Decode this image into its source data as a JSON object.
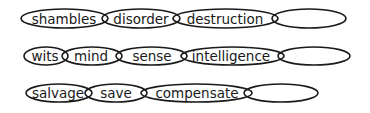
{
  "diagram": {
    "type": "word-chains",
    "rows": [
      {
        "name": "chain-1",
        "cy": 18.5,
        "ry": 9.5,
        "links": [
          {
            "word": "shambles",
            "x1": 21,
            "x2": 108
          },
          {
            "word": "disorder",
            "x1": 102,
            "x2": 180
          },
          {
            "word": "destruction",
            "x1": 173,
            "x2": 278
          },
          {
            "word": "",
            "x1": 272,
            "x2": 346
          }
        ]
      },
      {
        "name": "chain-2",
        "cy": 56,
        "ry": 9,
        "links": [
          {
            "word": "wits",
            "x1": 24,
            "x2": 68
          },
          {
            "word": "mind",
            "x1": 62,
            "x2": 122
          },
          {
            "word": "sense",
            "x1": 116,
            "x2": 187
          },
          {
            "word": "intelligence",
            "x1": 181,
            "x2": 284
          },
          {
            "word": "",
            "x1": 278,
            "x2": 350
          }
        ]
      },
      {
        "name": "chain-3",
        "cy": 93,
        "ry": 9,
        "links": [
          {
            "word": "salvage",
            "x1": 26,
            "x2": 92
          },
          {
            "word": "save",
            "x1": 85,
            "x2": 147
          },
          {
            "word": "compensate",
            "x1": 141,
            "x2": 252
          },
          {
            "word": "",
            "x1": 244,
            "x2": 318
          }
        ]
      }
    ],
    "colors": {
      "stroke": "#1a1a1a",
      "text": "#1a1a1a",
      "background": "#ffffff"
    }
  }
}
